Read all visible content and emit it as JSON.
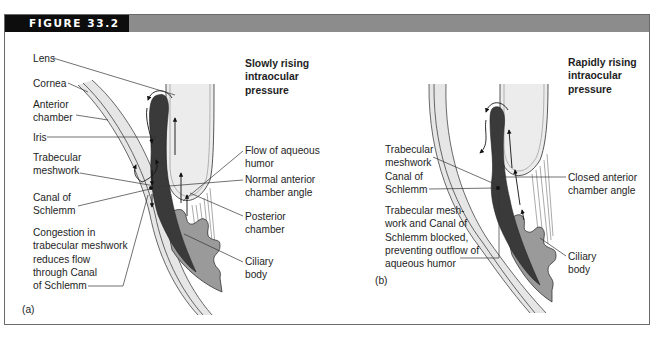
{
  "figure": {
    "title": "FIGURE 33.2",
    "header_bar_color": "#8c8c8c",
    "header_title_bg": "#0d0d0d"
  },
  "panel_a": {
    "tag": "(a)",
    "title_lines": [
      "Slowly rising",
      "intraocular",
      "pressure"
    ],
    "labels": {
      "lens": "Lens",
      "cornea": "Cornea",
      "anterior_chamber": [
        "Anterior",
        "chamber"
      ],
      "iris": "Iris",
      "trabecular_meshwork": [
        "Trabecular",
        "meshwork"
      ],
      "canal_of_schlemm": [
        "Canal of",
        "Schlemm"
      ],
      "congestion": [
        "Congestion in",
        "trabecular meshwork",
        "reduces flow",
        "through Canal",
        "of Schlemm"
      ],
      "flow_of_aqueous_humor": [
        "Flow of aqueous",
        "humor"
      ],
      "normal_angle": [
        "Normal anterior",
        "chamber angle"
      ],
      "posterior_chamber": [
        "Posterior",
        "chamber"
      ],
      "ciliary_body": [
        "Ciliary",
        "body"
      ]
    }
  },
  "panel_b": {
    "tag": "(b)",
    "title_lines": [
      "Rapidly rising",
      "intraocular",
      "pressure"
    ],
    "labels": {
      "trabecular_meshwork": [
        "Trabecular",
        "meshwork"
      ],
      "canal_of_schlemm": [
        "Canal of",
        "Schlemm"
      ],
      "blocked": [
        "Trabecular mesh-",
        "work and Canal of",
        "Schlemm blocked,",
        "preventing outflow of",
        "aqueous humor"
      ],
      "closed_angle": [
        "Closed anterior",
        "chamber angle"
      ],
      "ciliary_body": [
        "Ciliary",
        "body"
      ]
    }
  },
  "colors": {
    "iris": "#3a3a3a",
    "ciliary_body": "#9a9a9a",
    "lens": "#ececec",
    "cornea_fill": "#e6e6e6",
    "line": "#333333"
  }
}
